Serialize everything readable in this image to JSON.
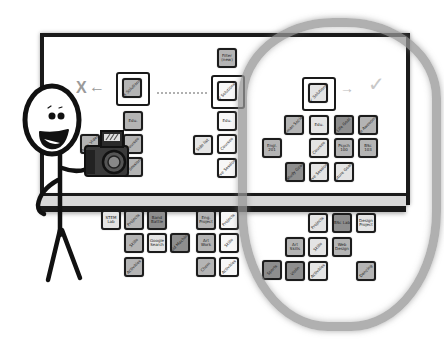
{
  "illustration": {
    "description": "Hand-drawn stick figure holding a camera in front of a card-sorting whiteboard",
    "colors": {
      "ink": "#1a1a1a",
      "card_dark": "#8e8e8e",
      "card_mid": "#b4b4b4",
      "card_light": "#e4e4e4",
      "highlight_oval": "#969696"
    }
  },
  "left_column": {
    "reject_marker": "X",
    "arrow": "←",
    "header_card": "X Solutions",
    "cards": [
      "Edu.",
      "Courses",
      "Life Sessions"
    ],
    "side_card": "Music Video"
  },
  "middle_column": {
    "top_card": "Filter (new)",
    "header_card": "/ Solutions",
    "cards": [
      "Edu.",
      "Courses",
      "Live Sessions"
    ],
    "side_card": "Side list"
  },
  "right_column": {
    "header_card": "✓ Solutions",
    "arrow": "→",
    "accept_marker": "✓",
    "cards": [
      "Human Society",
      "Edu.",
      "Life Goal",
      "Be Awesome",
      "Engl. 201",
      "Courses",
      "Psych 100",
      "BSc 103",
      "Study Goal",
      "Live Sessions",
      "Future Goals"
    ]
  },
  "lower_left_group": {
    "cards": [
      "STEM Lab",
      "Projects",
      "Band Battle",
      "Skills",
      "Google Search",
      "Fluid Machines",
      "Activities"
    ]
  },
  "lower_middle_group": {
    "cards": [
      "Eng. Project",
      "Projects",
      "Art Work",
      "Skills",
      "Chem",
      "Activities"
    ]
  },
  "lower_right_group": {
    "cards": [
      "Projects",
      "BSc Lab",
      "Design Project",
      "Art Skills",
      "Skills",
      "Web Design",
      "Sports",
      "Violin",
      "Activities",
      "Dancing"
    ]
  }
}
